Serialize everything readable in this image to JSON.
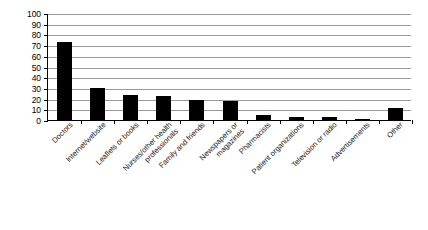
{
  "chart_data": {
    "type": "bar",
    "title": "",
    "subtitle": "",
    "xlabel": "",
    "ylabel": "",
    "ylim": [
      0,
      100
    ],
    "ytick_step": 10,
    "grid": true,
    "legend": false,
    "orientation": "vertical",
    "bar_color": "#000000",
    "gridline_color": "#9a9a9a",
    "axis_color": "#000000",
    "xtick_label_rotation": -45,
    "categories": [
      "Doctors",
      "Internet/website",
      "Leaflets or books",
      "Nurses/other health professionals",
      "Family and friends",
      "Newspapers or magazines",
      "Pharmacists",
      "Patient organizations",
      "Television or radio",
      "Advertisements",
      "Other"
    ],
    "values": [
      73,
      30,
      23,
      22,
      19,
      18,
      5,
      3,
      3,
      1,
      11
    ],
    "yticks": [
      0,
      10,
      20,
      30,
      40,
      50,
      60,
      70,
      80,
      90,
      100
    ],
    "ytick_labels": [
      "0",
      "10",
      "20",
      "30",
      "40",
      "50",
      "60",
      "70",
      "80",
      "90",
      "100"
    ]
  }
}
